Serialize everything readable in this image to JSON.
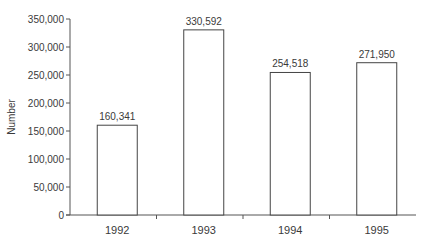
{
  "chart_data": {
    "type": "bar",
    "title": "",
    "xlabel": "",
    "ylabel": "Number",
    "categories": [
      "1992",
      "1993",
      "1994",
      "1995"
    ],
    "values": [
      160341,
      330592,
      254518,
      271950
    ],
    "value_labels": [
      "160,341",
      "330,592",
      "254,518",
      "271,950"
    ],
    "ylim": [
      0,
      350000
    ],
    "yticks": [
      0,
      50000,
      100000,
      150000,
      200000,
      250000,
      300000,
      350000
    ],
    "ytick_labels": [
      "0",
      "50,000",
      "100,000",
      "150,000",
      "200,000",
      "250,000",
      "300,000",
      "350,000"
    ],
    "grid": false,
    "legend": null,
    "bar_fill": "#ffffff",
    "bar_stroke": "#444444"
  }
}
